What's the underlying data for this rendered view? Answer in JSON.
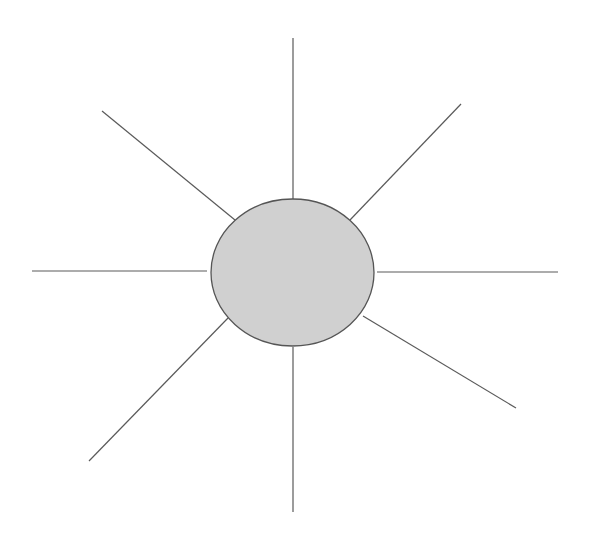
{
  "diagram": {
    "type": "spider-diagram",
    "canvas": {
      "width": 591,
      "height": 534,
      "background": "#ffffff"
    },
    "hub": {
      "label": "",
      "cx": 292.5,
      "cy": 272.5,
      "rx": 81.5,
      "ry": 73.5,
      "fill": "#d0d0d0",
      "stroke": "#555555"
    },
    "spokes": [
      {
        "id": "top",
        "label": "",
        "x1": 293,
        "y1": 199,
        "x2": 293,
        "y2": 38
      },
      {
        "id": "top-right",
        "label": "",
        "x1": 350,
        "y1": 220,
        "x2": 461,
        "y2": 104
      },
      {
        "id": "right",
        "label": "",
        "x1": 377,
        "y1": 272,
        "x2": 558,
        "y2": 272
      },
      {
        "id": "bottom-right",
        "label": "",
        "x1": 363,
        "y1": 316,
        "x2": 516,
        "y2": 408
      },
      {
        "id": "bottom",
        "label": "",
        "x1": 293,
        "y1": 347,
        "x2": 293,
        "y2": 512
      },
      {
        "id": "bottom-left",
        "label": "",
        "x1": 228,
        "y1": 318,
        "x2": 89,
        "y2": 461
      },
      {
        "id": "left",
        "label": "",
        "x1": 207,
        "y1": 271,
        "x2": 32,
        "y2": 271
      },
      {
        "id": "top-left",
        "label": "",
        "x1": 235,
        "y1": 220,
        "x2": 102,
        "y2": 111
      }
    ],
    "stroke_color": "#5a5a5a"
  }
}
